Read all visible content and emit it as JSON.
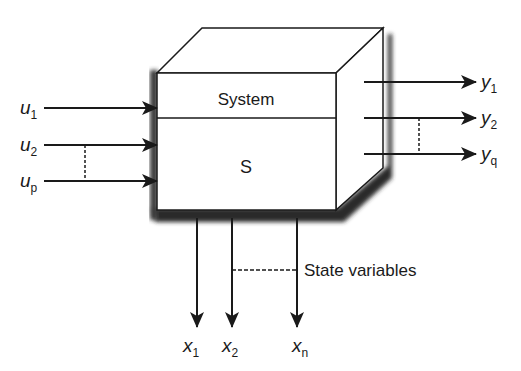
{
  "block": {
    "title": "System",
    "symbol": "S"
  },
  "inputs": [
    {
      "base": "u",
      "sub": "1"
    },
    {
      "base": "u",
      "sub": "2"
    },
    {
      "base": "u",
      "sub": "p"
    }
  ],
  "outputs": [
    {
      "base": "y",
      "sub": "1"
    },
    {
      "base": "y",
      "sub": "2"
    },
    {
      "base": "y",
      "sub": "q"
    }
  ],
  "states": [
    {
      "base": "x",
      "sub": "1"
    },
    {
      "base": "x",
      "sub": "2"
    },
    {
      "base": "x",
      "sub": "n"
    }
  ],
  "state_label": "State variables",
  "colors": {
    "ink": "#1a1a1a",
    "shadow": "#2a2a2a",
    "face": "#ffffff"
  }
}
